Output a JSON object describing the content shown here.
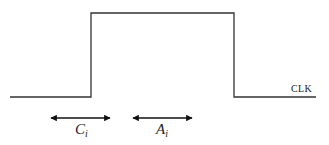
{
  "diagram": {
    "signal": {
      "label": "CLK",
      "color": "#222222",
      "waveform": {
        "low_y": 97,
        "high_y": 13,
        "start_x": 10,
        "rise_x": 91,
        "fall_x": 234,
        "end_x": 316
      }
    },
    "intervals": [
      {
        "name": "C",
        "subscript": "i",
        "from_x": 50,
        "to_x": 111
      },
      {
        "name": "A",
        "subscript": "i",
        "from_x": 132,
        "to_x": 193
      }
    ]
  }
}
